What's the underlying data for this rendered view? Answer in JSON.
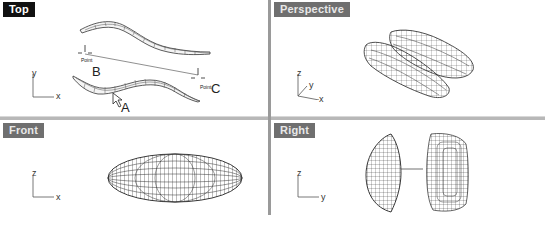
{
  "viewports": [
    {
      "id": "top",
      "label": "Top",
      "active": true,
      "axes": [
        "x",
        "y"
      ]
    },
    {
      "id": "perspective",
      "label": "Perspective",
      "active": false,
      "axes": [
        "x",
        "y",
        "z"
      ]
    },
    {
      "id": "front",
      "label": "Front",
      "active": false,
      "axes": [
        "x",
        "z"
      ]
    },
    {
      "id": "right",
      "label": "Right",
      "active": false,
      "axes": [
        "y",
        "z"
      ]
    }
  ],
  "top_view": {
    "points": [
      {
        "tag": "Point",
        "letter": "B"
      },
      {
        "tag": "Point",
        "letter": "C"
      }
    ],
    "cursor_label": "A"
  },
  "colors": {
    "active_label_bg": "#111111",
    "inactive_label_bg": "#6f6f6f",
    "divider": "#9a9a9a"
  }
}
